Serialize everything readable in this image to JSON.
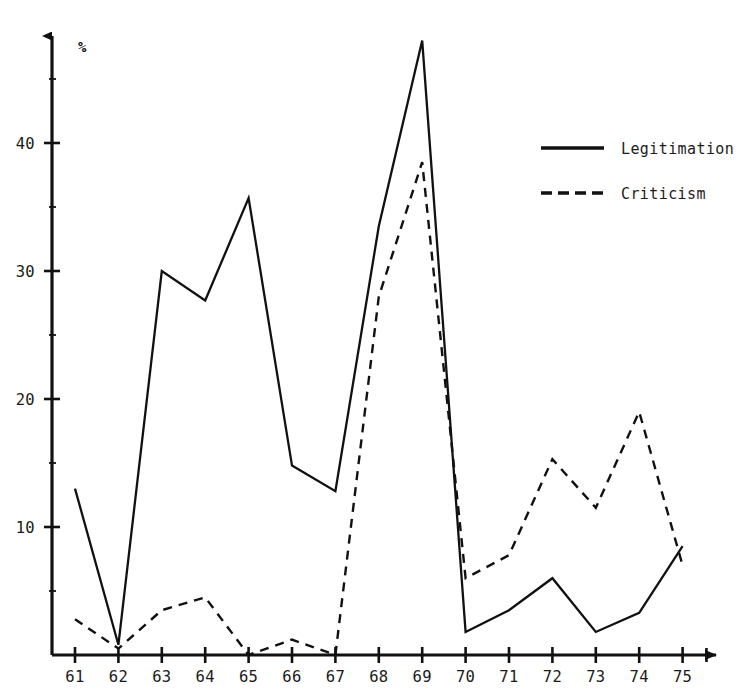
{
  "chart_data": {
    "type": "line",
    "title": "",
    "subtitle": "",
    "xlabel": "",
    "ylabel": "%",
    "unit_symbol": "%",
    "x": [
      61,
      62,
      63,
      64,
      65,
      66,
      67,
      68,
      69,
      70,
      71,
      72,
      73,
      74,
      75
    ],
    "categories": [
      "61",
      "62",
      "63",
      "64",
      "65",
      "66",
      "67",
      "68",
      "69",
      "70",
      "71",
      "72",
      "73",
      "74",
      "75"
    ],
    "xlim": [
      60.5,
      75.9
    ],
    "ylim": [
      0,
      48
    ],
    "ytick_labels": [
      "10",
      "20",
      "30",
      "40"
    ],
    "yticks": [
      10,
      20,
      30,
      40
    ],
    "yminor_ticks": [
      5,
      15,
      25,
      35,
      45
    ],
    "grid": false,
    "legend_position": "right-top",
    "series": [
      {
        "name": "Legitimation",
        "style": "solid",
        "color": "#111111",
        "values": [
          13.0,
          0.8,
          30.0,
          27.7,
          35.7,
          14.8,
          12.8,
          33.5,
          48.0,
          1.8,
          3.5,
          6.0,
          1.8,
          3.3,
          8.5
        ]
      },
      {
        "name": "Criticism",
        "style": "dashed",
        "color": "#111111",
        "values": [
          2.8,
          0.5,
          3.5,
          4.5,
          0.0,
          1.2,
          0.0,
          28.0,
          38.5,
          6.0,
          7.8,
          15.3,
          11.5,
          19.0,
          7.0
        ]
      }
    ]
  },
  "legend": {
    "entries": [
      {
        "label": "Legitimation",
        "style": "solid"
      },
      {
        "label": "Criticism",
        "style": "dashed"
      }
    ]
  },
  "axes": {
    "y_unit": "%",
    "x_arrow": "arrow-right-icon",
    "y_arrow": "arrow-up-icon"
  }
}
